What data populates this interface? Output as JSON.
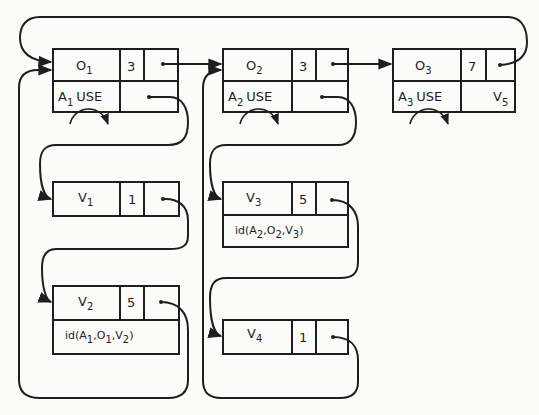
{
  "diagram": {
    "object_nodes": [
      {
        "id": "O1",
        "name": "O",
        "name_sub": "1",
        "count": "3",
        "attr": "A",
        "attr_sub": "1",
        "attr_label": "USE",
        "extra": "",
        "extra_sub": ""
      },
      {
        "id": "O2",
        "name": "O",
        "name_sub": "2",
        "count": "3",
        "attr": "A",
        "attr_sub": "2",
        "attr_label": "USE",
        "extra": "",
        "extra_sub": ""
      },
      {
        "id": "O3",
        "name": "O",
        "name_sub": "3",
        "count": "7",
        "attr": "A",
        "attr_sub": "3",
        "attr_label": "USE",
        "extra": "V",
        "extra_sub": "5"
      }
    ],
    "value_nodes": [
      {
        "id": "V1",
        "name": "V",
        "name_sub": "1",
        "count": "1",
        "id_fn": null
      },
      {
        "id": "V2",
        "name": "V",
        "name_sub": "2",
        "count": "5",
        "id_fn": {
          "prefix": "id(A",
          "a_sub": "1",
          "mid1": ",O",
          "o_sub": "1",
          "mid2": ",V",
          "v_sub": "2",
          "suffix": ")"
        }
      },
      {
        "id": "V3",
        "name": "V",
        "name_sub": "3",
        "count": "5",
        "id_fn": {
          "prefix": "id(A",
          "a_sub": "2",
          "mid1": ",O",
          "o_sub": "2",
          "mid2": ",V",
          "v_sub": "3",
          "suffix": ")"
        }
      },
      {
        "id": "V4",
        "name": "V",
        "name_sub": "4",
        "count": "1",
        "id_fn": null
      }
    ],
    "edges": [
      {
        "from": "O1.next",
        "to": "O2"
      },
      {
        "from": "O2.next",
        "to": "O3"
      },
      {
        "from": "O3.next",
        "to": "O1"
      },
      {
        "from": "O1.values",
        "to": "V1"
      },
      {
        "from": "V1.next",
        "to": "V2"
      },
      {
        "from": "V2.next",
        "to": "O1"
      },
      {
        "from": "O2.values",
        "to": "V3"
      },
      {
        "from": "V3.next",
        "to": "V4"
      },
      {
        "from": "V4.next",
        "to": "O2"
      }
    ]
  }
}
